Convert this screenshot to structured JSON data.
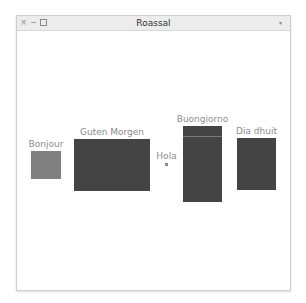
{
  "window": {
    "title": "Roassal",
    "close_glyph": "×",
    "minimize_glyph": "−",
    "menu_glyph": "▾"
  },
  "colors": {
    "light_box": "#808080",
    "dark_box": "#444444",
    "label": "#8c8c8c"
  },
  "canvas": {
    "elements": [
      {
        "label": "Bonjour",
        "x": 31,
        "y": 151,
        "w": 30,
        "h": 28,
        "color": "#808080"
      },
      {
        "label": "Guten Morgen",
        "x": 74,
        "y": 139,
        "w": 76,
        "h": 52,
        "color": "#444444"
      },
      {
        "label": "Hola",
        "x": 165,
        "y": 163,
        "w": 3,
        "h": 3,
        "color": "#8a8a8a"
      },
      {
        "label": "Buongiorno",
        "x": 183,
        "y": 126,
        "w": 39,
        "h": 76,
        "color": "#444444"
      },
      {
        "label": "Dia dhuit",
        "x": 237,
        "y": 138,
        "w": 39,
        "h": 52,
        "color": "#444444"
      }
    ]
  }
}
